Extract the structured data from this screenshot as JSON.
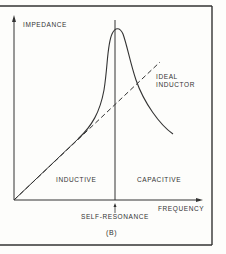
{
  "figure": {
    "label": "(B)",
    "y_axis_label": "IMPEDANCE",
    "x_axis_label": "FREQUENCY",
    "resonance_label": "SELF-RESONANCE",
    "region_left": "INDUCTIVE",
    "region_right": "CAPACITIVE",
    "ideal_line_label_1": "IDEAL",
    "ideal_line_label_2": "INDUCTOR"
  },
  "colors": {
    "background": "#fdfdfb",
    "ink": "#333333"
  }
}
